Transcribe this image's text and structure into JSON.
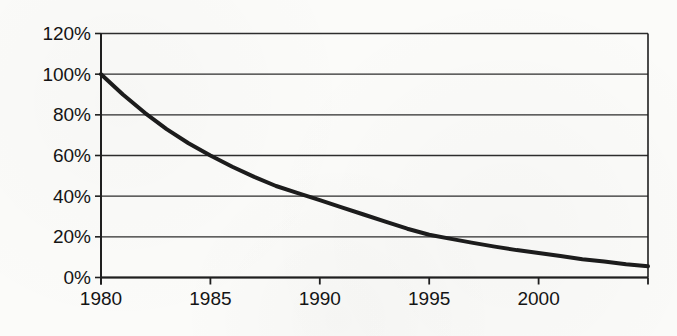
{
  "chart": {
    "background_color": "#fbfbf9",
    "line_color": "#1c1c1c",
    "grid_color": "#2d2d2d",
    "axis_color": "#1f1f1f",
    "text_color": "#141414"
  },
  "chart_data": {
    "type": "line",
    "title": "",
    "subtitle": "",
    "xlabel": "",
    "ylabel": "",
    "legend": "none",
    "grid": "horizontal",
    "unit": "%",
    "xlim": [
      1980,
      2005
    ],
    "ylim": [
      0,
      120
    ],
    "x_tick_step_years": 5,
    "x_tick_labels": [
      "1980",
      "1985",
      "1990",
      "1995",
      "2000"
    ],
    "x_ticks_labeled_years": [
      1980,
      1985,
      1990,
      1995,
      2000
    ],
    "x_ticks_all_years": [
      1980,
      1985,
      1990,
      1995,
      2000,
      2005
    ],
    "y_ticks": [
      0,
      20,
      40,
      60,
      80,
      100,
      120
    ],
    "y_tick_labels": [
      "0%",
      "20%",
      "40%",
      "60%",
      "80%",
      "100%",
      "120%"
    ],
    "series": [
      {
        "name": "decay-curve",
        "x": [
          1980,
          1981,
          1982,
          1983,
          1984,
          1985,
          1986,
          1987,
          1988,
          1989,
          1990,
          1991,
          1992,
          1993,
          1994,
          1995,
          1996,
          1997,
          1998,
          1999,
          2000,
          2001,
          2002,
          2003,
          2004,
          2005
        ],
        "values": [
          100,
          90,
          81,
          73,
          66,
          60,
          54.5,
          49.5,
          45,
          41.5,
          38,
          34.5,
          31,
          27.5,
          24,
          21,
          19,
          17,
          15.2,
          13.5,
          12,
          10.5,
          9,
          7.8,
          6.5,
          5.5
        ]
      }
    ],
    "key_points": {
      "1980": 100,
      "1985": 60,
      "1990": 38,
      "1995": 21,
      "2000": 12,
      "2005": 5.5
    }
  }
}
